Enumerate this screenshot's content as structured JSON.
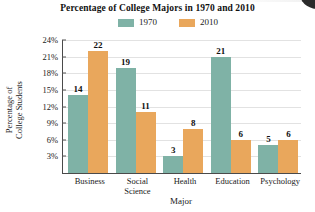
{
  "chart_data": {
    "type": "bar",
    "title": "Percentage of College Majors in 1970 and 2010",
    "xlabel": "Major",
    "ylabel": "Percentage of College Students",
    "ylabel_line1": "Percentage of",
    "ylabel_line2": "College Students",
    "categories": [
      "Business",
      "Social Science",
      "Health",
      "Education",
      "Psychology"
    ],
    "category_lines": [
      [
        "Business"
      ],
      [
        "Social",
        "Science"
      ],
      [
        "Health"
      ],
      [
        "Education"
      ],
      [
        "Psychology"
      ]
    ],
    "series": [
      {
        "name": "1970",
        "color": "#7fb2a6",
        "values": [
          14,
          19,
          3,
          21,
          5
        ]
      },
      {
        "name": "2010",
        "color": "#e9a75c",
        "values": [
          22,
          11,
          8,
          6,
          6
        ]
      }
    ],
    "legend": [
      {
        "label": "1970",
        "color": "#7fb2a6"
      },
      {
        "label": "2010",
        "color": "#e9a75c"
      }
    ],
    "legend_position": "top-center",
    "ylim": [
      0,
      24
    ],
    "yticks": [
      24,
      21,
      18,
      15,
      12,
      9,
      6,
      3
    ],
    "ytick_labels": [
      "24%",
      "21%",
      "18%",
      "15%",
      "12%",
      "9%",
      "6%",
      "3%"
    ],
    "grid": true,
    "grid_axis": "y",
    "value_labels_shown": true
  }
}
